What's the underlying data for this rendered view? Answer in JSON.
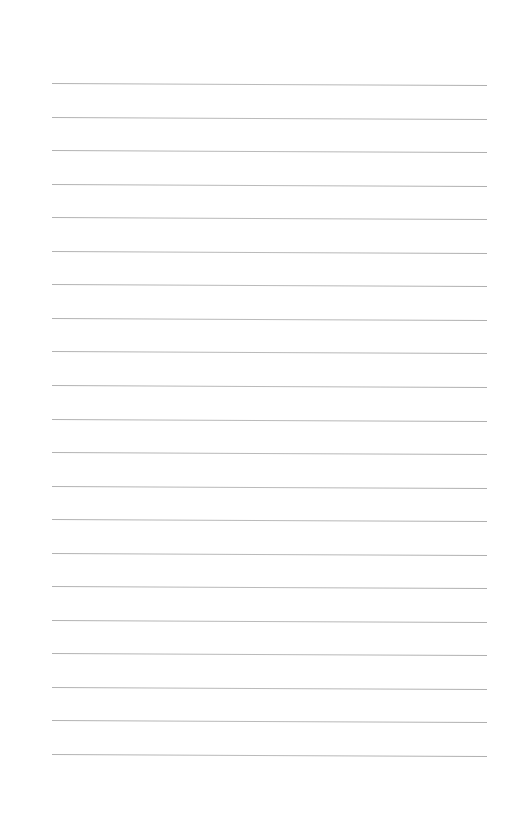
{
  "page": {
    "type": "blank lined notebook paper",
    "background_color": "#ffffff",
    "rule_color": "#aaaaaa",
    "rule_count": 21,
    "first_rule_y": 83,
    "rule_spacing": 33.55,
    "rule_left_x": 52,
    "rule_right_x": 487,
    "text_content": ""
  }
}
